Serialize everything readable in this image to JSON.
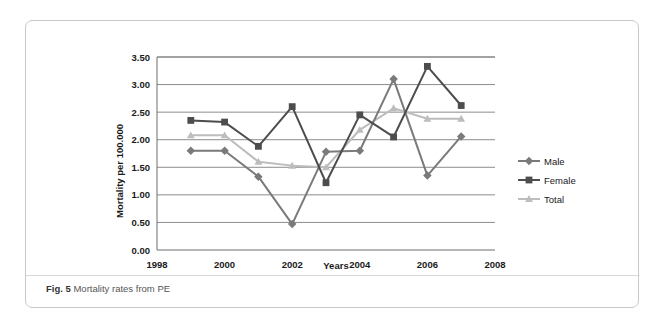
{
  "figure": {
    "caption_label": "Fig. 5",
    "caption_text": "Mortality rates from PE"
  },
  "chart_data": {
    "type": "line",
    "title": "",
    "xlabel": "Years",
    "ylabel": "Mortality per 100.000",
    "x": [
      1999,
      2000,
      2001,
      2002,
      2003,
      2004,
      2005,
      2006,
      2007
    ],
    "xlim": [
      1998,
      2008
    ],
    "xticks": [
      1998,
      2000,
      2002,
      2004,
      2006,
      2008
    ],
    "xticklabels": [
      "1998",
      "2000",
      "2002",
      "2004",
      "2006",
      "2008"
    ],
    "ylim": [
      0.0,
      3.5
    ],
    "yticks": [
      0.0,
      0.5,
      1.0,
      1.5,
      2.0,
      2.5,
      3.0,
      3.5
    ],
    "yticklabels": [
      "0.00",
      "0.50",
      "1.00",
      "1.50",
      "2.00",
      "2.50",
      "3.00",
      "3.50"
    ],
    "grid": true,
    "legend_position": "right",
    "series": [
      {
        "name": "Male",
        "marker": "diamond",
        "color": "#7a7a7a",
        "values": [
          1.8,
          1.8,
          1.33,
          0.47,
          1.78,
          1.8,
          3.1,
          1.35,
          2.06
        ]
      },
      {
        "name": "Female",
        "marker": "square",
        "color": "#4d4d4d",
        "values": [
          2.35,
          2.32,
          1.88,
          2.6,
          1.22,
          2.45,
          2.05,
          3.33,
          2.62
        ]
      },
      {
        "name": "Total",
        "marker": "triangle",
        "color": "#bdbdbd",
        "values": [
          2.08,
          2.08,
          1.6,
          1.53,
          1.5,
          2.18,
          2.57,
          2.38,
          2.38
        ]
      }
    ]
  }
}
